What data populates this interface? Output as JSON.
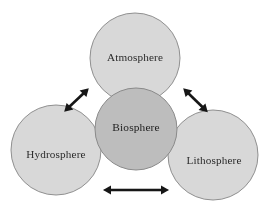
{
  "diagram": {
    "background_color": "#ffffff",
    "width": 270,
    "height": 213,
    "circle_fill_outer": "#d8d8d8",
    "circle_fill_center": "#bdbdbd",
    "circle_stroke": "#8f8f8f",
    "arrow_color": "#141414",
    "label_color": "#2b2b2b",
    "spheres": [
      {
        "id": "atmosphere",
        "label": "Atmosphere",
        "position": "top",
        "cx": 135,
        "cy": 58,
        "r": 45,
        "fill": "#d8d8d8",
        "emphasis": "outer"
      },
      {
        "id": "biosphere",
        "label": "Biosphere",
        "position": "center",
        "cx": 136,
        "cy": 129,
        "r": 41,
        "fill": "#bdbdbd",
        "emphasis": "center"
      },
      {
        "id": "hydrosphere",
        "label": "Hydrosphere",
        "position": "bottom-left",
        "cx": 56,
        "cy": 150,
        "r": 45,
        "fill": "#d8d8d8",
        "emphasis": "outer"
      },
      {
        "id": "lithosphere",
        "label": "Lithosphere",
        "position": "bottom-right",
        "cx": 213,
        "cy": 155,
        "r": 45,
        "fill": "#d8d8d8",
        "emphasis": "outer"
      }
    ],
    "arrows": [
      {
        "id": "arrow-hydrosphere-atmosphere",
        "type": "double-headed",
        "connects": [
          "hydrosphere",
          "atmosphere"
        ],
        "orientation": "diagonal-up-right",
        "x1": 65,
        "y1": 111,
        "x2": 88,
        "y2": 89
      },
      {
        "id": "arrow-atmosphere-lithosphere",
        "type": "double-headed",
        "connects": [
          "atmosphere",
          "lithosphere"
        ],
        "orientation": "diagonal-down-right",
        "x1": 184,
        "y1": 89,
        "x2": 207,
        "y2": 112
      },
      {
        "id": "arrow-hydrosphere-lithosphere",
        "type": "double-headed",
        "connects": [
          "hydrosphere",
          "lithosphere"
        ],
        "orientation": "horizontal",
        "x1": 104,
        "y1": 190,
        "x2": 168,
        "y2": 190
      }
    ]
  }
}
